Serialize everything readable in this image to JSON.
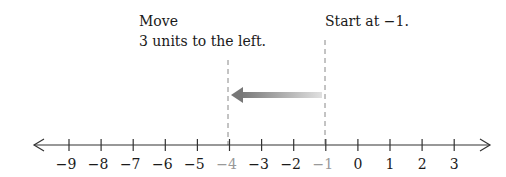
{
  "annotations": {
    "move_line1": "Move",
    "move_line2": "3 units to the left.",
    "start": "Start at −1."
  },
  "number_line": {
    "ticks": [
      {
        "value": -9,
        "label": "−9",
        "highlight": false
      },
      {
        "value": -8,
        "label": "−8",
        "highlight": false
      },
      {
        "value": -7,
        "label": "−7",
        "highlight": false
      },
      {
        "value": -6,
        "label": "−6",
        "highlight": false
      },
      {
        "value": -5,
        "label": "−5",
        "highlight": false
      },
      {
        "value": -4,
        "label": "−4",
        "highlight": true
      },
      {
        "value": -3,
        "label": "−3",
        "highlight": false
      },
      {
        "value": -2,
        "label": "−2",
        "highlight": false
      },
      {
        "value": -1,
        "label": "−1",
        "highlight": true
      },
      {
        "value": 0,
        "label": "0",
        "highlight": false
      },
      {
        "value": 1,
        "label": "1",
        "highlight": false
      },
      {
        "value": 2,
        "label": "2",
        "highlight": false
      },
      {
        "value": 3,
        "label": "3",
        "highlight": false
      }
    ],
    "start_value": -1,
    "end_value": -4,
    "move": -3
  },
  "colors": {
    "axis": "#333333",
    "highlight_label": "#999999",
    "arrow_dark": "#777777",
    "arrow_light": "#dddddd",
    "dashed": "#888888"
  }
}
